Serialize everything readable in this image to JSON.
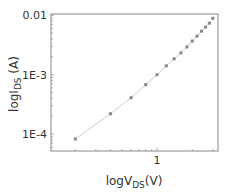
{
  "chart_data": {
    "type": "scatter",
    "title": "",
    "xlabel": "logV_DS(V)",
    "ylabel": "logI_DS (A)",
    "xlabel_parts": {
      "main": "logV",
      "sub": "DS",
      "unit": "(V)"
    },
    "ylabel_parts": {
      "main": "logI",
      "sub": "DS",
      "unit": " (A)"
    },
    "xscale": "log",
    "yscale": "log",
    "xlim": [
      0.124,
      3.32
    ],
    "ylim": [
      5.2e-05,
      0.0105
    ],
    "x_ticks": [
      {
        "value": 1,
        "label": "1"
      }
    ],
    "y_ticks": [
      {
        "value": 0.01,
        "label": "0.01"
      },
      {
        "value": 0.001,
        "label": "1E-3"
      },
      {
        "value": 0.0001,
        "label": "1E-4"
      }
    ],
    "grid": false,
    "legend": null,
    "series": [
      {
        "name": "I_DS",
        "marker": "square",
        "color": "#888888",
        "line_color": "#cccccc",
        "x": [
          0.2,
          0.4,
          0.6,
          0.8,
          1.0,
          1.2,
          1.4,
          1.6,
          1.8,
          2.0,
          2.2,
          2.4,
          2.6,
          2.8,
          3.0
        ],
        "y": [
          8.3e-05,
          0.00022,
          0.00041,
          0.00068,
          0.001,
          0.00141,
          0.00185,
          0.00233,
          0.00293,
          0.00368,
          0.00446,
          0.0054,
          0.0063,
          0.00736,
          0.0089
        ]
      }
    ]
  },
  "colors": {
    "frame": "#888888",
    "tick": "#999999",
    "text": "#333333",
    "marker": "#888888",
    "line": "#d0d0d0"
  }
}
